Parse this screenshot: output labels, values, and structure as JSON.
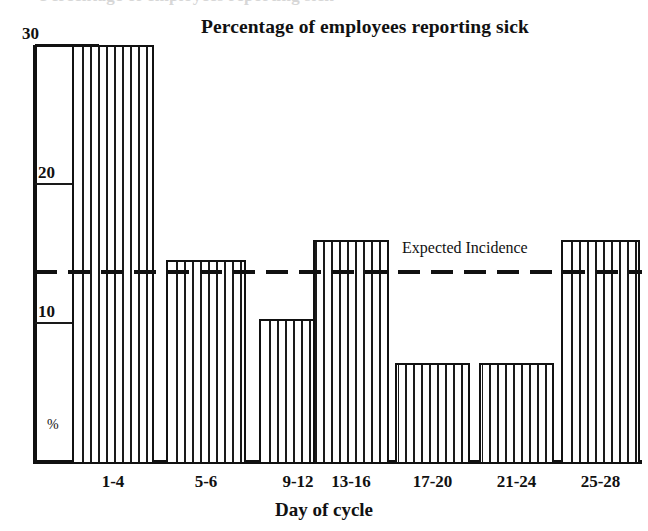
{
  "chart_data": {
    "type": "bar",
    "title": "Percentage of employees reporting sick",
    "xlabel": "Day of cycle",
    "ylabel": "%",
    "categories": [
      "1-4",
      "5-6",
      "9-12",
      "13-16",
      "17-20",
      "21-24",
      "25-28"
    ],
    "values": [
      30,
      14.5,
      10.3,
      16,
      7.1,
      7.1,
      16
    ],
    "ylim": [
      0,
      30
    ],
    "yticks": [
      10,
      20,
      30
    ],
    "ytick_labels": [
      "10",
      "20",
      "30"
    ],
    "grid": false,
    "legend": "none",
    "annotations": [
      {
        "name": "expected-incidence",
        "label": "Expected Incidence",
        "type": "horizontal-reference-line",
        "value": 14.5,
        "style": "dashed"
      }
    ],
    "bar_style": {
      "fill": "vertical-hatch",
      "outline_color": "#111111",
      "fill_color": "#ffffff",
      "hatch_color": "#1a1a1a"
    }
  },
  "page": {
    "cut_off_text_top": "Percentage of employees reporting sick"
  }
}
